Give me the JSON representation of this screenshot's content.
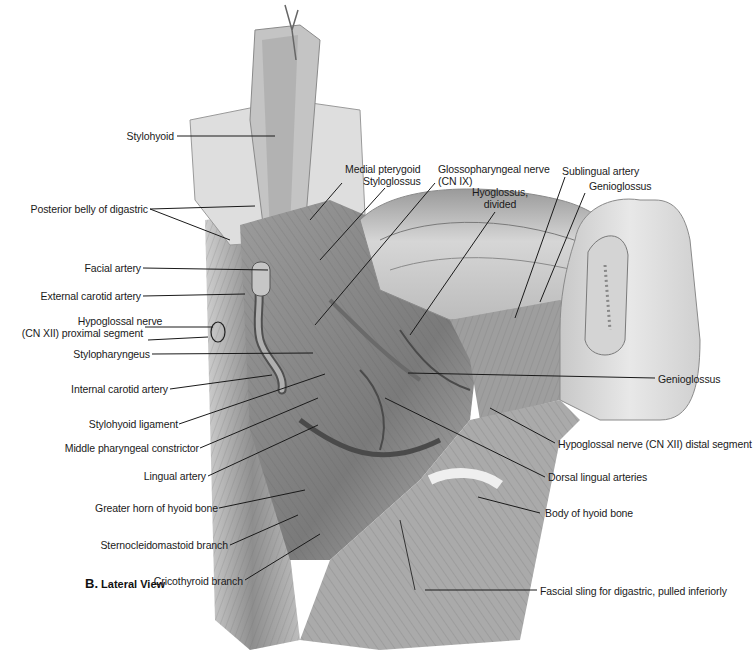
{
  "figure": {
    "caption_letter": "B.",
    "caption_text": "Lateral View",
    "palette": {
      "background": "#ffffff",
      "tissue_light": "#d9d9d9",
      "tissue_mid": "#a8a8a8",
      "tissue_dark": "#5c5c5c",
      "leader_line": "#1a1a1a",
      "label_text": "#1a1a1a"
    }
  },
  "labels": {
    "left": [
      {
        "id": "stylohyoid",
        "text": "Stylohyoid"
      },
      {
        "id": "posterior-belly-digastric",
        "text": "Posterior belly of digastric"
      },
      {
        "id": "facial-artery",
        "text": "Facial artery"
      },
      {
        "id": "external-carotid-artery",
        "text": "External carotid artery"
      },
      {
        "id": "hypoglossal-proximal-1",
        "text": "Hypoglossal nerve"
      },
      {
        "id": "hypoglossal-proximal-2",
        "text": "(CN XII) proximal segment"
      },
      {
        "id": "stylopharyngeus",
        "text": "Stylopharyngeus"
      },
      {
        "id": "internal-carotid-artery",
        "text": "Internal carotid artery"
      },
      {
        "id": "stylohyoid-ligament",
        "text": "Stylohyoid ligament"
      },
      {
        "id": "middle-pharyngeal-constrictor",
        "text": "Middle pharyngeal constrictor"
      },
      {
        "id": "lingual-artery",
        "text": "Lingual artery"
      },
      {
        "id": "greater-horn-hyoid",
        "text": "Greater horn of hyoid bone"
      },
      {
        "id": "sternocleidomastoid-branch",
        "text": "Sternocleidomastoid branch"
      },
      {
        "id": "cricothyroid-branch",
        "text": "Cricothyroid branch"
      }
    ],
    "top": [
      {
        "id": "medial-pterygoid",
        "text": "Medial pterygoid"
      },
      {
        "id": "styloglossus",
        "text": "Styloglossus"
      },
      {
        "id": "glossopharyngeal-1",
        "text": "Glossopharyngeal nerve"
      },
      {
        "id": "glossopharyngeal-2",
        "text": "(CN IX)"
      },
      {
        "id": "hyoglossus-1",
        "text": "Hyoglossus,"
      },
      {
        "id": "hyoglossus-2",
        "text": "divided"
      },
      {
        "id": "sublingual-artery",
        "text": "Sublingual artery"
      },
      {
        "id": "genioglossus-top",
        "text": "Genioglossus"
      }
    ],
    "right": [
      {
        "id": "genioglossus-right",
        "text": "Genioglossus"
      },
      {
        "id": "hypoglossal-distal",
        "text": "Hypoglossal nerve (CN XII) distal segment"
      },
      {
        "id": "dorsal-lingual-arteries",
        "text": "Dorsal lingual arteries"
      },
      {
        "id": "body-hyoid",
        "text": "Body of hyoid bone"
      },
      {
        "id": "fascial-sling",
        "text": "Fascial sling for digastric, pulled inferiorly"
      }
    ]
  }
}
